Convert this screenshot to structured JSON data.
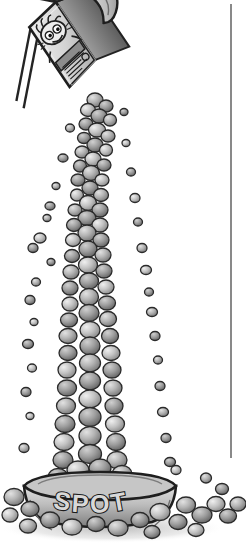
{
  "image": {
    "title": "Cereal box pouring kibble into a dog bowl",
    "medium": "grayscale cartoon line illustration",
    "background_color": "#ffffff",
    "width": 246,
    "height": 550
  },
  "palette": {
    "ink": "#1a1a1a",
    "outline": "#2b2b2b",
    "kibble_light": "#d2d2d2",
    "kibble_mid": "#a8a8a8",
    "kibble_dark": "#6e6e6e",
    "kibble_shadow": "#4a4a4a",
    "bowl_light": "#cfcfcf",
    "bowl_mid": "#9f9f9f",
    "bowl_dark": "#6a6a6a",
    "box_light": "#dcdcdc",
    "box_mid": "#b0b0b0",
    "box_dark": "#555555",
    "paper_white": "#f4f4f4",
    "rule": "#4a4a4a",
    "ground_shadow": "#bcbcbc"
  },
  "rule": {
    "label": "vertical border rule",
    "x": 231,
    "y_top": 4,
    "y_bottom": 458,
    "width": 1.3,
    "color": "#4a4a4a"
  },
  "box": {
    "label": "cereal box",
    "tilt_degrees": -34,
    "mascot": {
      "label": "cartoon mascot face",
      "features": [
        "wild hair tufts",
        "two large eyes",
        "grinning mouth",
        "whisker strokes"
      ]
    },
    "top_panel": {
      "label": "hatched top panel",
      "hatch_count": 22
    },
    "front_text_lines": {
      "label": "illegible scribbled package copy",
      "line_count": 5
    },
    "spout": {
      "label": "opened pouring flap"
    }
  },
  "stream": {
    "label": "falling kibble stream",
    "narrow_top_width": 26,
    "wide_bottom_width": 74,
    "top_y": 96,
    "bottom_y": 478,
    "piece_count": 210,
    "stray_count": 46
  },
  "bowl": {
    "label": "dog food bowl",
    "text": "SPOT",
    "text_style": "outlined block capitals on a curve",
    "rim_label": "flared bowl rim",
    "center_x": 100,
    "top_y": 470,
    "bottom_y": 525,
    "width": 150
  },
  "ground": {
    "label": "spilled kibble on ground",
    "piece_count": 34,
    "shadow_label": "soft cast shadow"
  }
}
